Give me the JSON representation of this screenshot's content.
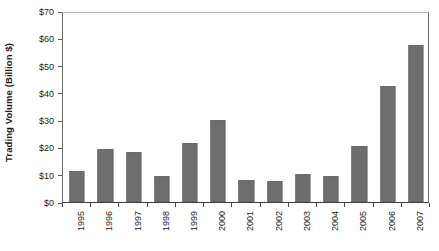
{
  "chart_data": {
    "type": "bar",
    "title": "",
    "xlabel": "",
    "ylabel": "Trading Volume (Billion $)",
    "categories": [
      "1995",
      "1996",
      "1997",
      "1998",
      "1999",
      "2000",
      "2001",
      "2002",
      "2003",
      "2004",
      "2005",
      "2006",
      "2007"
    ],
    "values": [
      11.5,
      19.5,
      18.5,
      9.5,
      21.8,
      30.0,
      8.2,
      7.7,
      10.2,
      9.7,
      20.5,
      42.6,
      57.4
    ],
    "ylim": [
      0,
      70
    ],
    "ytick_step": 10,
    "ytick_labels": [
      "$0",
      "$10",
      "$20",
      "$30",
      "$40",
      "$50",
      "$60",
      "$70"
    ],
    "ytick_values": [
      0,
      10,
      20,
      30,
      40,
      50,
      60,
      70
    ],
    "grid": false,
    "legend": "none",
    "bar_color": "#6e6e6e",
    "axis_color": "#4a4a4a",
    "background_color": "#ffffff"
  }
}
